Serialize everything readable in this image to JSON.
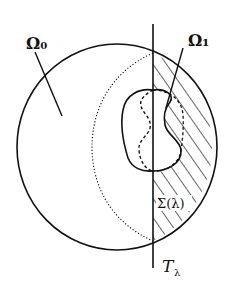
{
  "diagram": {
    "type": "geometric-figure",
    "labels": {
      "omega0": "Ω₀",
      "omega1": "Ω₁",
      "sigma": "Σ(λ)",
      "t_lambda": "T",
      "t_lambda_sub": "λ"
    },
    "elements": [
      {
        "name": "outer-domain-boundary",
        "shape": "circle",
        "label": "Ω₀"
      },
      {
        "name": "hyperplane",
        "shape": "vertical-line",
        "label": "Tλ"
      },
      {
        "name": "reflected-arc",
        "shape": "dotted-arc"
      },
      {
        "name": "inner-domain",
        "shape": "closed-curve",
        "label": "Ω₁"
      },
      {
        "name": "reflected-inner-domain",
        "shape": "dashed-curve"
      },
      {
        "name": "cap-region",
        "shape": "hatched-region",
        "label": "Σ(λ)"
      }
    ],
    "colors": {
      "stroke": "#111111",
      "background": "#ffffff"
    }
  }
}
